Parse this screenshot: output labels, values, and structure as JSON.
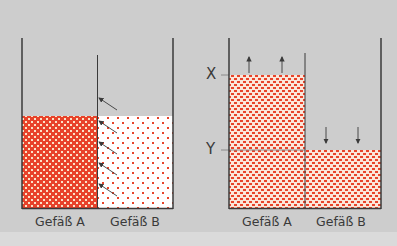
{
  "colors": {
    "background": "#cdcdcd",
    "fluid_dense": "#e8432a",
    "fluid_dot": "#e8432a",
    "fluid_light_bg": "#ffffff",
    "wall": "#3a3a3a",
    "arrow": "#3a3a3a"
  },
  "left_diagram": {
    "vessel_a_label": "Gefäß A",
    "vessel_b_label": "Gefäß B",
    "description": "Two vessels separated by a semi-permeable membrane; equal levels; arrows show solvent flowing from B into A"
  },
  "right_diagram": {
    "vessel_a_label": "Gefäß A",
    "vessel_b_label": "Gefäß B",
    "level_x_label": "X",
    "level_y_label": "Y",
    "description": "After osmosis: level in A rises to X, level in B falls to Y"
  }
}
